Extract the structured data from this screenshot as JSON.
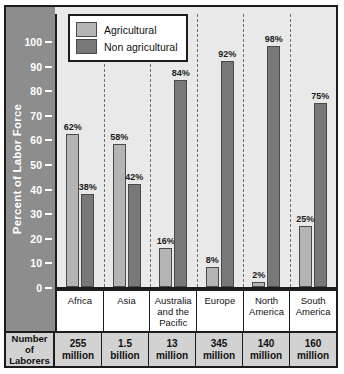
{
  "chart_data": {
    "type": "bar",
    "title": "",
    "xlabel": "",
    "ylabel": "Percent of Labor Force",
    "ylim": [
      0,
      100
    ],
    "ytick_labels": [
      "100",
      "90",
      "80",
      "70",
      "60",
      "50",
      "40",
      "30",
      "20",
      "10",
      "0"
    ],
    "ytick_values": [
      100,
      90,
      80,
      70,
      60,
      50,
      40,
      30,
      20,
      10,
      0
    ],
    "grid": "dashed vertical separators between category groups",
    "legend_position": "top-left inside plot",
    "categories": [
      "Africa",
      "Asia",
      "Australia and the Pacific",
      "Europe",
      "North America",
      "South America"
    ],
    "series": [
      {
        "name": "Agricultural",
        "color": "#b4b4b4",
        "values": [
          62,
          58,
          16,
          8,
          2,
          25
        ],
        "labels": [
          "62%",
          "58%",
          "16%",
          "8%",
          "2%",
          "25%"
        ]
      },
      {
        "name": "Non agricultural",
        "color": "#787878",
        "values": [
          38,
          42,
          84,
          92,
          98,
          75
        ],
        "labels": [
          "38%",
          "42%",
          "84%",
          "92%",
          "98%",
          "75%"
        ]
      }
    ]
  },
  "legend": {
    "items": [
      {
        "label": "Agricultural",
        "color": "#b4b4b4"
      },
      {
        "label": "Non agricultural",
        "color": "#787878"
      }
    ]
  },
  "category_labels": [
    "Africa",
    "Asia",
    "Australia and the Pacific",
    "Europe",
    "North America",
    "South America"
  ],
  "data_table": {
    "row_header": "Number of Laborers",
    "cells": [
      {
        "number": "255",
        "unit": "million"
      },
      {
        "number": "1.5",
        "unit": "billion"
      },
      {
        "number": "13",
        "unit": "million"
      },
      {
        "number": "345",
        "unit": "million"
      },
      {
        "number": "140",
        "unit": "million"
      },
      {
        "number": "160",
        "unit": "million"
      }
    ]
  },
  "colors": {
    "agricultural": "#b4b4b4",
    "non_agricultural": "#787878",
    "axis_band": "#8d8d8d",
    "plot_background": "#e9e9e9",
    "table_background": "#d2d2d2",
    "frame": "#1c1c1c"
  }
}
